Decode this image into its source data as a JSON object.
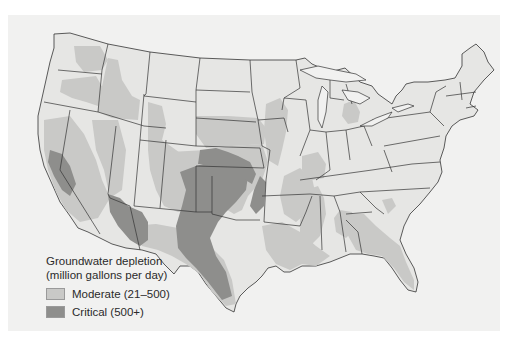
{
  "map": {
    "subject": "Groundwater depletion in the contiguous United States",
    "colors": {
      "background": "#f1f1f0",
      "land": "#e6e6e4",
      "moderate": "#c9c9c7",
      "critical": "#8e8e8c",
      "border": "#333333"
    }
  },
  "legend": {
    "title_line1": "Groundwater depletion",
    "title_line2": "(million gallons per day)",
    "items": [
      {
        "label": "Moderate (21–500)",
        "color": "#c9c9c7"
      },
      {
        "label": "Critical (500+)",
        "color": "#8e8e8c"
      }
    ]
  }
}
